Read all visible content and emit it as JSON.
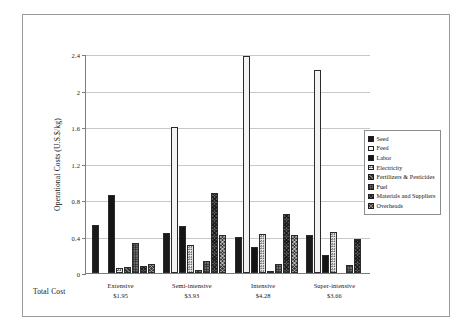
{
  "chart_data": {
    "type": "bar",
    "title": "",
    "subtitle": "",
    "xlabel": "",
    "ylabel": "Operational Costs (U.S.$/kg)",
    "ylim": [
      0,
      2.4
    ],
    "yticks": [
      "0",
      "0.4",
      "0.8",
      "1.2",
      "1.6",
      "2",
      "2.4"
    ],
    "ytick_values": [
      0,
      0.4,
      0.8,
      1.2,
      1.6,
      2,
      2.4
    ],
    "grid": true,
    "legend_position": "right",
    "categories": [
      "Extensive",
      "Semi-intensive",
      "Intensive",
      "Super-intensive"
    ],
    "category_totals_label": "Total Cost",
    "category_totals": [
      "$1.95",
      "$3.93",
      "$4.28",
      "$3.66"
    ],
    "series": [
      {
        "name": "Seed",
        "pattern": "p-seed",
        "values": [
          0.53,
          0.44,
          0.4,
          0.42
        ]
      },
      {
        "name": "Feed",
        "pattern": "p-feed",
        "values": [
          0.0,
          1.6,
          2.38,
          2.22
        ]
      },
      {
        "name": "Labor",
        "pattern": "p-labor",
        "values": [
          0.85,
          0.52,
          0.28,
          0.2
        ]
      },
      {
        "name": "Electricity",
        "pattern": "p-electricity",
        "values": [
          0.06,
          0.31,
          0.43,
          0.45
        ]
      },
      {
        "name": "Fertilizers & Pesticides",
        "pattern": "p-fert",
        "values": [
          0.07,
          0.03,
          0.02,
          0.0
        ]
      },
      {
        "name": "Fuel",
        "pattern": "p-fuel",
        "values": [
          0.33,
          0.13,
          0.1,
          0.09
        ]
      },
      {
        "name": "Materials and Suppliers",
        "pattern": "p-materials",
        "values": [
          0.08,
          0.88,
          0.65,
          0.37
        ]
      },
      {
        "name": "Overheads",
        "pattern": "p-overheads",
        "values": [
          0.1,
          0.42,
          0.42,
          0.0
        ]
      }
    ]
  },
  "legend": {
    "items": [
      {
        "label": "Seed"
      },
      {
        "label": "Feed"
      },
      {
        "label": "Labor"
      },
      {
        "label": "Electricity"
      },
      {
        "label": "Fertilizers & Pesticides"
      },
      {
        "label": "Fuel"
      },
      {
        "label": "Materials and Suppliers"
      },
      {
        "label": "Overheads"
      }
    ]
  },
  "colors": {
    "frame": "#9a9a9a",
    "axis": "#7d7d7d",
    "gridline": "#c8c8c8",
    "text": "#111111",
    "background": "#ffffff"
  }
}
